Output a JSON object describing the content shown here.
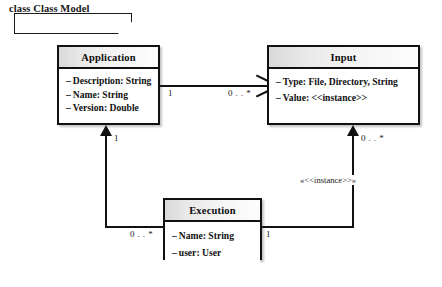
{
  "diagram": {
    "kind": "uml-class-diagram",
    "frame_label": "class Class Model",
    "background_color": "#ffffff",
    "line_color": "#111111",
    "header_fill": "#e8e8e8"
  },
  "classes": [
    {
      "id": "application",
      "name": "Application",
      "attributes": [
        {
          "visibility": "–",
          "text": "Description: String"
        },
        {
          "visibility": "–",
          "text": "Name: String"
        },
        {
          "visibility": "–",
          "text": "Version: Double"
        }
      ]
    },
    {
      "id": "input",
      "name": "Input",
      "attributes": [
        {
          "visibility": "–",
          "text": "Type:  File, Directory, String"
        },
        {
          "visibility": "–",
          "text": "Value:  <<instance>>"
        }
      ]
    },
    {
      "id": "execution",
      "name": "Execution",
      "attributes": [
        {
          "visibility": "–",
          "text": "Name: String"
        },
        {
          "visibility": "–",
          "text": "user: User"
        }
      ]
    }
  ],
  "associations": [
    {
      "id": "application-input",
      "source": "application",
      "target": "input",
      "source_multiplicity": "1",
      "target_multiplicity": "0 . . *",
      "arrowhead": "open"
    },
    {
      "id": "execution-application",
      "source": "execution",
      "target": "application",
      "source_multiplicity": "0 . . *",
      "target_multiplicity": "1",
      "arrowhead": "solid"
    },
    {
      "id": "execution-input",
      "source": "execution",
      "target": "input",
      "source_multiplicity": "1",
      "target_multiplicity": "0 . . *",
      "arrowhead": "solid",
      "stereotype": "«<<instance>>»"
    }
  ]
}
